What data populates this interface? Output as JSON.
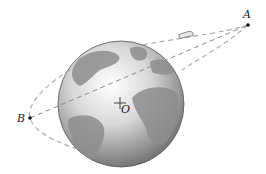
{
  "diagram": {
    "labels": {
      "apogee": "A",
      "perigee": "B",
      "center": "O"
    },
    "points": {
      "A": [
        248,
        25
      ],
      "B": [
        30,
        118
      ],
      "O": [
        120,
        103
      ]
    },
    "earth": {
      "cx": 121,
      "cy": 104,
      "r": 63
    },
    "colors": {
      "orbit_dash": "#a8a8a8",
      "earth_light": "#f2f2f2",
      "earth_dark": "#6e6e6e",
      "land": "#8a8a8a",
      "point": "#111111"
    }
  }
}
